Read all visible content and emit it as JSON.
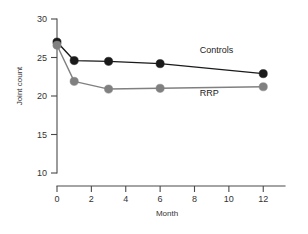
{
  "chart_data": {
    "type": "line",
    "title": "",
    "xlabel": "Month",
    "ylabel": "Joint count",
    "x": [
      0,
      1,
      3,
      6,
      12
    ],
    "xlim": [
      0,
      12.8
    ],
    "ylim": [
      10,
      30
    ],
    "xticks": [
      0,
      2,
      4,
      6,
      8,
      10,
      12
    ],
    "yticks": [
      10,
      15,
      20,
      25,
      30
    ],
    "xtick_labels": [
      "0",
      "2",
      "4",
      "6",
      "8",
      "10",
      "12"
    ],
    "ytick_labels": [
      "10",
      "15",
      "20",
      "25",
      "30"
    ],
    "grid": false,
    "legend_position": "inline-right",
    "series": [
      {
        "name": "Controls",
        "color": "#1a1a1a",
        "marker": "circle",
        "values": [
          27.0,
          24.6,
          24.5,
          24.2,
          22.9
        ],
        "label_x": 8.3,
        "label_y": 25.6
      },
      {
        "name": "RRP",
        "color": "#808080",
        "marker": "circle",
        "values": [
          26.6,
          21.9,
          20.9,
          21.0,
          21.2
        ],
        "label_x": 8.3,
        "label_y": 20.0
      }
    ]
  },
  "axis": {
    "y_label_text": "Joint count",
    "x_label_text": "Month"
  }
}
